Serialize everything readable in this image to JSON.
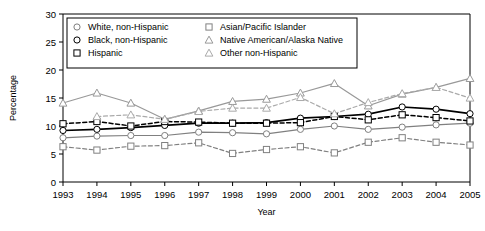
{
  "chart_data": {
    "type": "line",
    "title": "",
    "xlabel": "Year",
    "ylabel": "Percentage",
    "x": [
      1993,
      1994,
      1995,
      1996,
      1997,
      1998,
      1999,
      2000,
      2001,
      2002,
      2003,
      2004,
      2005
    ],
    "xtick_labels": [
      "1993",
      "1994",
      "1995",
      "1996",
      "1997",
      "1998",
      "1999",
      "2000",
      "2001",
      "2002",
      "2003",
      "2004",
      "2005"
    ],
    "ytick_labels": [
      "0",
      "5",
      "10",
      "15",
      "20",
      "25",
      "30"
    ],
    "yticks": [
      0,
      5,
      10,
      15,
      20,
      25,
      30
    ],
    "ylim": [
      0,
      30
    ],
    "xlim": [
      1993,
      2005
    ],
    "grid": false,
    "legend_position": "top-left-inside",
    "series": [
      {
        "name": "White, non-Hispanic",
        "marker": "circle",
        "linestyle": "solid",
        "color": "#808080",
        "values": [
          7.9,
          8.2,
          8.3,
          8.3,
          8.9,
          8.8,
          8.6,
          9.4,
          10.0,
          9.4,
          9.8,
          10.2,
          10.5
        ]
      },
      {
        "name": "Black, non-Hispanic",
        "marker": "circle",
        "linestyle": "solid",
        "color": "#000000",
        "values": [
          9.2,
          9.4,
          9.7,
          10.1,
          10.5,
          10.5,
          10.6,
          11.4,
          11.7,
          12.1,
          13.4,
          13.0,
          12.2
        ]
      },
      {
        "name": "Hispanic",
        "marker": "square",
        "linestyle": "dashed",
        "color": "#000000",
        "values": [
          10.4,
          10.8,
          10.0,
          10.8,
          10.7,
          10.5,
          10.5,
          10.6,
          11.7,
          11.1,
          12.0,
          11.5,
          10.9
        ]
      },
      {
        "name": "Asian/Pacific Islander",
        "marker": "square",
        "linestyle": "dashed",
        "color": "#808080",
        "values": [
          6.3,
          5.7,
          6.4,
          6.5,
          7.0,
          5.1,
          5.8,
          6.3,
          5.2,
          7.1,
          7.9,
          7.1,
          6.6
        ]
      },
      {
        "name": "Native American/Alaska Native",
        "marker": "triangle",
        "linestyle": "solid",
        "color": "#999999",
        "values": [
          14.1,
          15.9,
          14.1,
          11.2,
          12.7,
          14.4,
          14.8,
          15.9,
          17.6,
          13.6,
          15.7,
          16.9,
          18.5
        ]
      },
      {
        "name": "Other non-Hispanic",
        "marker": "triangle",
        "linestyle": "dashed",
        "color": "#aaaaaa",
        "values": [
          null,
          11.7,
          12.0,
          11.2,
          12.6,
          13.2,
          13.2,
          15.1,
          12.2,
          14.2,
          15.8,
          16.9,
          15.0
        ]
      }
    ]
  },
  "legend": {
    "entries": [
      {
        "label": "White, non-Hispanic"
      },
      {
        "label": "Black, non-Hispanic"
      },
      {
        "label": "Hispanic"
      },
      {
        "label": "Asian/Pacific Islander"
      },
      {
        "label": "Native American/Alaska Native"
      },
      {
        "label": "Other non-Hispanic"
      }
    ]
  },
  "axes": {
    "y_title": "Percentage",
    "x_title": "Year"
  },
  "colors": {
    "black": "#000000",
    "gray": "#808080",
    "light_gray": "#999999",
    "frame": "#000000",
    "background": "#ffffff"
  }
}
